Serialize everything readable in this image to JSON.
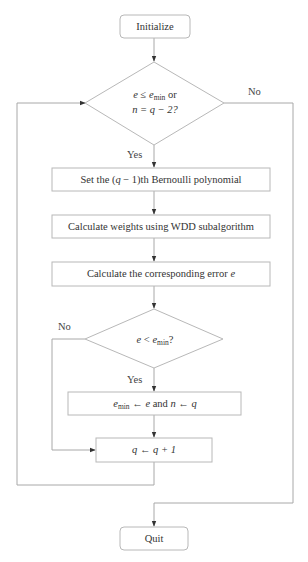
{
  "diagram": {
    "type": "flowchart",
    "nodes": {
      "start": {
        "shape": "rounded-rect",
        "label": "Initialize"
      },
      "decision1": {
        "shape": "diamond",
        "line1_pre": "e",
        "line1_op": " ≤ ",
        "line1_var": "e",
        "line1_sub": "min",
        "line1_post": " or",
        "line2": "n = q − 2?"
      },
      "step1": {
        "shape": "rect",
        "label_pre": "Set the (",
        "label_var": "q",
        "label_post": " − 1)th Bernoulli polynomial"
      },
      "step2": {
        "shape": "rect",
        "label": "Calculate weights using WDD subalgorithm"
      },
      "step3": {
        "shape": "rect",
        "label_pre": "Calculate the corresponding error ",
        "label_var": "e"
      },
      "decision2": {
        "shape": "diamond",
        "pre": "e",
        "op": " < ",
        "var": "e",
        "sub": "min",
        "post": "?"
      },
      "step4": {
        "shape": "rect",
        "var1": "e",
        "sub1": "min",
        "rest1": " ← e",
        "and": " and ",
        "rest2": "n ← q"
      },
      "step5": {
        "shape": "rect",
        "label": "q ← q + 1"
      },
      "end": {
        "shape": "rounded-rect",
        "label": "Quit"
      }
    },
    "edge_labels": {
      "d1_yes": "Yes",
      "d1_no": "No",
      "d2_yes": "Yes",
      "d2_no": "No"
    },
    "edges": [
      {
        "from": "start",
        "to": "decision1"
      },
      {
        "from": "decision1",
        "to": "step1",
        "label": "Yes"
      },
      {
        "from": "decision1",
        "to": "end",
        "label": "No"
      },
      {
        "from": "step1",
        "to": "step2"
      },
      {
        "from": "step2",
        "to": "step3"
      },
      {
        "from": "step3",
        "to": "decision2"
      },
      {
        "from": "decision2",
        "to": "step4",
        "label": "Yes"
      },
      {
        "from": "decision2",
        "to": "step5",
        "label": "No"
      },
      {
        "from": "step4",
        "to": "step5"
      },
      {
        "from": "step5",
        "to": "decision1"
      }
    ],
    "colors": {
      "stroke": "#b8b8b8",
      "text": "#333333",
      "arrow": "#333333",
      "background": "#ffffff"
    }
  }
}
